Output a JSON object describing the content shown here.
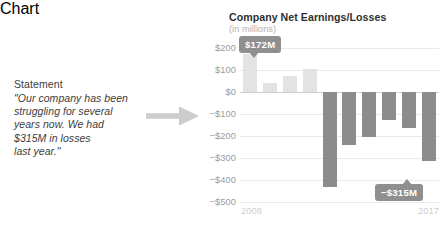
{
  "statement": {
    "label": "Statement",
    "quote_lines": [
      "\"Our company has been",
      "struggling for several",
      "years now. We had",
      "$315M in losses",
      "last year.\""
    ]
  },
  "arrow": {
    "icon": "arrow-right-icon"
  },
  "chart_data": {
    "type": "bar",
    "title": "Company Net Earnings/Losses",
    "subtitle": "(in millions)",
    "xlabel": "",
    "ylabel": "",
    "categories": [
      "2008",
      "2009",
      "2010",
      "2011",
      "2012",
      "2013",
      "2014",
      "2015",
      "2016",
      "2017"
    ],
    "values": [
      172,
      40,
      75,
      105,
      -430,
      -240,
      -205,
      -125,
      -165,
      -315
    ],
    "ylim": [
      -500,
      200
    ],
    "ytick_labels": [
      "$200",
      "$100",
      "$0",
      "−$100",
      "−$200",
      "−$300",
      "−$400",
      "−$500"
    ],
    "ytick_values": [
      200,
      100,
      0,
      -100,
      -200,
      -300,
      -400,
      -500
    ],
    "xtick_labels": [
      "2008",
      "2017"
    ],
    "grid": true,
    "legend": "none",
    "colors": {
      "positive_bar": "#e3e3e3",
      "negative_bar": "#8c8c8c",
      "gridline": "#e9e9e9",
      "zero_line": "#d2d2d2",
      "callout": "#8f8f8f",
      "title_text": "#2f2f2f",
      "axis_text": "#9b9b9b"
    },
    "annotations": [
      {
        "name": "peak-callout",
        "label": "$172M",
        "value": 172,
        "category": "2008",
        "direction": "down"
      },
      {
        "name": "trough-callout",
        "label": "−$315M",
        "value": -315,
        "category": "2017",
        "direction": "up"
      }
    ]
  }
}
